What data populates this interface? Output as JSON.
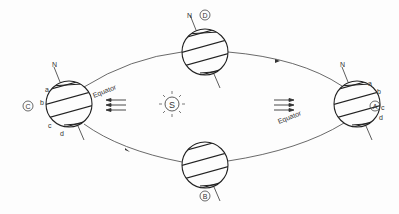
{
  "diagram": {
    "sun_label": "S",
    "equator_label": "Equator",
    "north_label": "N",
    "positions": [
      {
        "id": "A",
        "label": "A"
      },
      {
        "id": "B",
        "label": "B"
      },
      {
        "id": "C",
        "label": "C"
      },
      {
        "id": "D",
        "label": "D"
      }
    ],
    "latitude_labels": [
      "a",
      "b",
      "c",
      "d"
    ],
    "colors": {
      "line": "#333333",
      "background": "#fdfdfd"
    }
  }
}
